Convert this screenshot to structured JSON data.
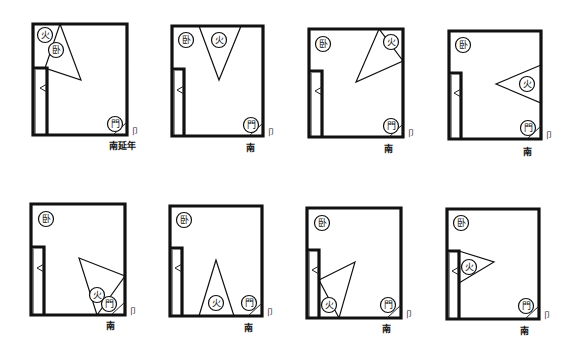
{
  "figure": {
    "legend": {
      "bedroom": "卧",
      "fire": "火",
      "door": "門",
      "door_mark": "卩"
    },
    "colors": {
      "ink": "#111111",
      "background": "#ffffff"
    },
    "diagrams": [
      {
        "id": 1,
        "caption": "南延年",
        "fire_label": "火",
        "bed_label": "卧",
        "door_label": "門"
      },
      {
        "id": 2,
        "caption": "南",
        "fire_label": "火",
        "bed_label": "卧",
        "door_label": "門"
      },
      {
        "id": 3,
        "caption": "南",
        "fire_label": "火",
        "bed_label": "卧",
        "door_label": "門"
      },
      {
        "id": 4,
        "caption": "南",
        "fire_label": "火",
        "bed_label": "卧",
        "door_label": "門"
      },
      {
        "id": 5,
        "caption": "南",
        "fire_label": "火",
        "bed_label": "卧",
        "door_label": "門"
      },
      {
        "id": 6,
        "caption": "南",
        "fire_label": "火",
        "bed_label": "卧",
        "door_label": "門"
      },
      {
        "id": 7,
        "caption": "南",
        "fire_label": "火",
        "bed_label": "卧",
        "door_label": "門"
      },
      {
        "id": 8,
        "caption": "南",
        "fire_label": "火",
        "bed_label": "卧",
        "door_label": "門"
      }
    ]
  }
}
